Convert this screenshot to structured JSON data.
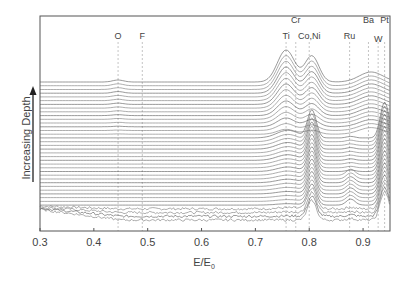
{
  "chart_data": {
    "type": "line",
    "title": "",
    "xlabel": "E/E0",
    "ylabel": "Increasing Depth",
    "xlim": [
      0.3,
      0.95
    ],
    "xticks": [
      0.3,
      0.4,
      0.5,
      0.6,
      0.7,
      0.8,
      0.9
    ],
    "yticks": [],
    "grid": false,
    "legend": null,
    "element_markers": [
      {
        "label": "O",
        "x": 0.445,
        "row": 2
      },
      {
        "label": "F",
        "x": 0.49,
        "row": 2
      },
      {
        "label": "Ti",
        "x": 0.757,
        "row": 2
      },
      {
        "label": "Cr",
        "x": 0.775,
        "row": 1
      },
      {
        "label": "Co,Ni",
        "x": 0.8,
        "row": 2
      },
      {
        "label": "Ru",
        "x": 0.875,
        "row": 2
      },
      {
        "label": "Ba",
        "x": 0.91,
        "row": 1
      },
      {
        "label": "W",
        "x": 0.928,
        "row": 2.3
      },
      {
        "label": "Pt",
        "x": 0.94,
        "row": 1
      }
    ],
    "series_groups": [
      {
        "name": "upper traces (shallow, top of stack)",
        "count": 14,
        "peaks": [
          {
            "x": 0.757,
            "height_rel": 1.0
          },
          {
            "x": 0.805,
            "height_rel": 0.8
          },
          {
            "x": 0.915,
            "height_rel": 0.35
          }
        ]
      },
      {
        "name": "middle traces",
        "count": 16,
        "peaks": [
          {
            "x": 0.805,
            "height_rel": 0.9
          },
          {
            "x": 0.94,
            "height_rel": 1.0
          }
        ]
      },
      {
        "name": "lower traces (deep)",
        "count": 8,
        "peaks": [
          {
            "x": 0.805,
            "height_rel": 0.7
          },
          {
            "x": 0.877,
            "height_rel": 0.2
          },
          {
            "x": 0.94,
            "height_rel": 0.8
          }
        ]
      }
    ]
  },
  "axis": {
    "tick_labels": [
      "0.3",
      "0.4",
      "0.5",
      "0.6",
      "0.7",
      "0.8",
      "0.9"
    ],
    "x_title_main": "E/E",
    "x_title_sub": "0",
    "y_title": "Increasing Depth"
  }
}
